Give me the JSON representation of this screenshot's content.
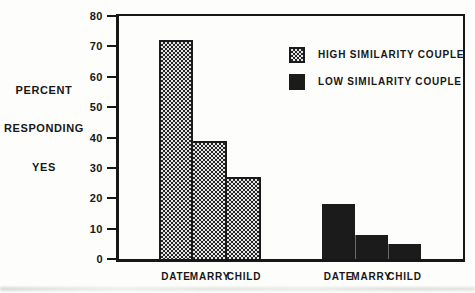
{
  "figure": {
    "background": "#fdfdfb",
    "ink_color": "#171717"
  },
  "chart_data": {
    "type": "bar",
    "title": "",
    "ylabel_lines": [
      "PERCENT",
      "RESPONDING",
      "YES"
    ],
    "xlabel": "",
    "ylim": [
      0,
      80
    ],
    "yticks": [
      0,
      10,
      20,
      30,
      40,
      50,
      60,
      70,
      80
    ],
    "grid": false,
    "legend_position": "top-right-inside",
    "categories": [
      "DATE",
      "MARRY",
      "CHILD"
    ],
    "series": [
      {
        "name": "HIGH SIMILARITY COUPLE",
        "fill": "hatched",
        "values": [
          72,
          39,
          27
        ]
      },
      {
        "name": "LOW SIMILARITY COUPLE",
        "fill": "solid",
        "values": [
          18,
          8,
          5
        ]
      }
    ]
  }
}
